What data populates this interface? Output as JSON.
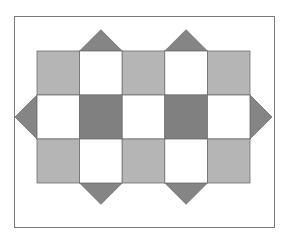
{
  "diagram": {
    "colors": {
      "light": "#b5b5b5",
      "dark": "#808080",
      "white": "#ffffff",
      "triangle": "#858585",
      "stroke": "#6e6e6e",
      "frame": "#7a7a7a"
    },
    "grid": {
      "left": 37,
      "top": 51,
      "cell_w": 42.6,
      "cell_h": 44,
      "rows": [
        [
          "light",
          "white",
          "light",
          "white",
          "light"
        ],
        [
          "white",
          "dark",
          "white",
          "dark",
          "white"
        ],
        [
          "light",
          "white",
          "light",
          "white",
          "light"
        ]
      ]
    },
    "triangles": [
      {
        "side": "top",
        "col": 1
      },
      {
        "side": "top",
        "col": 3
      },
      {
        "side": "bottom",
        "col": 1
      },
      {
        "side": "bottom",
        "col": 3
      },
      {
        "side": "left",
        "row": 1
      },
      {
        "side": "right",
        "row": 1
      }
    ]
  }
}
